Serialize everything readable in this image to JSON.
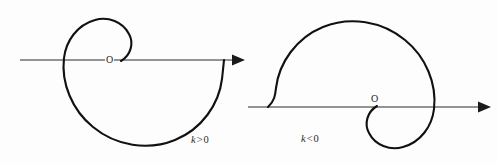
{
  "figure": {
    "background_color": "#fdfdfd",
    "curve_color": "#111111",
    "axis_color": "#2a2a2a",
    "width": 498,
    "height": 163
  },
  "panels": [
    {
      "id": "left",
      "origin_label": "O",
      "caption_variable": "k",
      "caption_operator": ">",
      "caption_value": "0",
      "caption_text": "k > 0",
      "axis": {
        "orientation": "horizontal",
        "arrow_direction": "right",
        "start_x": 20,
        "end_x": 237,
        "y": 60
      },
      "curve": {
        "type": "spiral",
        "description": "spiral unwinding counter-clockwise outward from the origin, inner hook above the axis, large outer arc sweeping below",
        "origin_x": 113,
        "origin_y": 60
      }
    },
    {
      "id": "right",
      "origin_label": "O",
      "caption_variable": "k",
      "caption_operator": "<",
      "caption_value": "0",
      "caption_text": "k < 0",
      "axis": {
        "orientation": "horizontal",
        "arrow_direction": "right",
        "start_x": 248,
        "end_x": 489,
        "y": 107
      },
      "curve": {
        "type": "spiral",
        "description": "mirrored spiral unwinding clockwise outward from the origin, inner hook below the axis, large outer arc sweeping above",
        "origin_x": 376,
        "origin_y": 107
      }
    }
  ],
  "chart_data": {
    "type": "line",
    "xlabel": "",
    "ylabel": "",
    "grid": false,
    "legend": "none",
    "annotations": [
      "O",
      "k > 0",
      "O",
      "k < 0"
    ],
    "series": [
      {
        "name": "k > 0",
        "description": "Spiral starting at origin (113,60), hooking up and left, sweeping counter-clockwise outward and terminating on the axis at x=224",
        "path": "M 121,61 C 131,55 134,43 129,34 C 123,22 108,16 95,20 C 77,25 66,41 64,58 C 61,83 72,110 93,127 C 116,146 148,151 175,140 C 202,129 219,104 222,79 C 222.8,72 223.4,66 224,60"
      },
      {
        "name": "k < 0",
        "description": "Mirrored spiral starting at origin (376,107), hooking down and right, sweeping clockwise outward and terminating on the axis at x=267",
        "path": "M 377,106 C 367,112 364,124 369,133 C 375,145 390,151 403,147 C 421,142 432,126 434,109 C 437,84 426,57 405,40 C 382,21 350,16 323,27 C 296,38 279,63 276,88 C 275.2,95 274.6,101 268,107"
      }
    ]
  }
}
